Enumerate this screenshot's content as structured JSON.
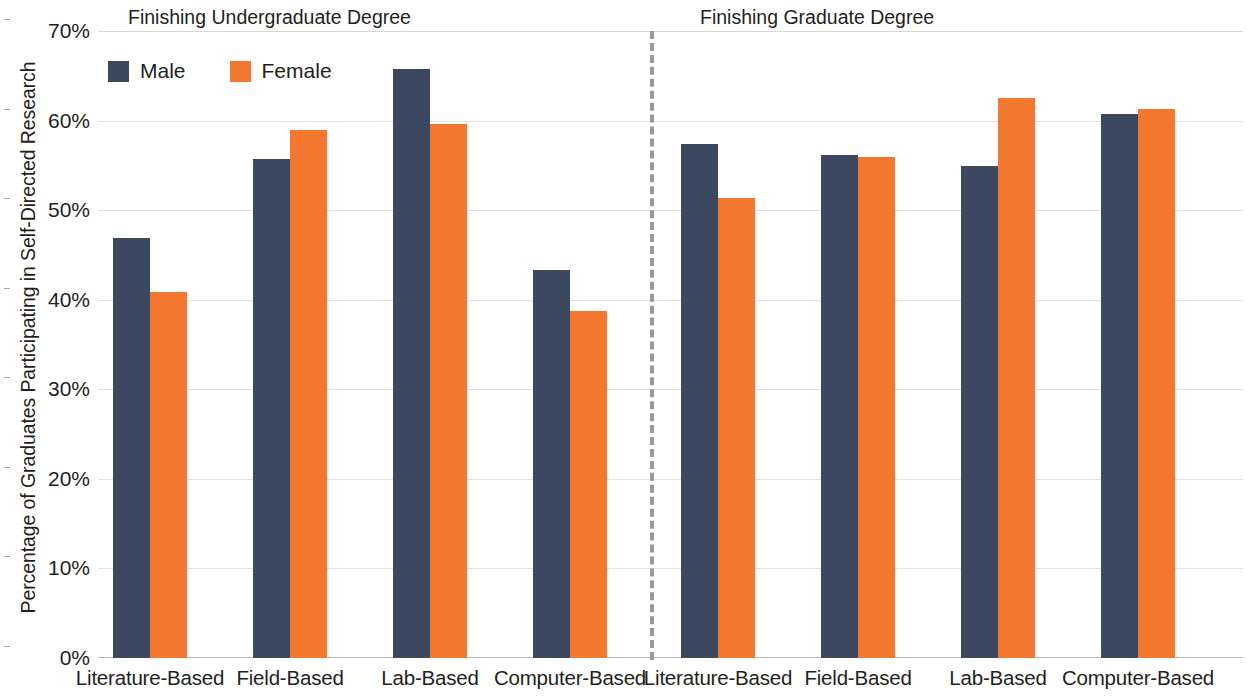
{
  "chart_data": {
    "type": "bar",
    "title": "",
    "xlabel": "",
    "ylabel": "Percentage of Graduates Participating in Self-Directed Research",
    "ylim": [
      0,
      70
    ],
    "ytick_labels": [
      "0%",
      "10%",
      "20%",
      "30%",
      "40%",
      "50%",
      "60%",
      "70%"
    ],
    "ytick_values": [
      0,
      10,
      20,
      30,
      40,
      50,
      60,
      70
    ],
    "grid": true,
    "legend_position": "top-left",
    "legend": [
      "Male",
      "Female"
    ],
    "colors": {
      "male": "#3c4860",
      "female": "#f4772f",
      "divider": "#999999",
      "grid": "#e2e2e2"
    },
    "panels": [
      {
        "title": "Finishing Undergraduate Degree",
        "categories": [
          "Literature-Based",
          "Field-Based",
          "Lab-Based",
          "Computer-Based"
        ],
        "series": [
          {
            "name": "Male",
            "values": [
              46.9,
              55.7,
              65.8,
              43.3
            ]
          },
          {
            "name": "Female",
            "values": [
              40.9,
              58.9,
              59.6,
              38.7
            ]
          }
        ]
      },
      {
        "title": "Finishing Graduate Degree",
        "categories": [
          "Literature-Based",
          "Field-Based",
          "Lab-Based",
          "Computer-Based"
        ],
        "series": [
          {
            "name": "Male",
            "values": [
              57.4,
              56.2,
              54.9,
              60.7
            ]
          },
          {
            "name": "Female",
            "values": [
              51.4,
              55.9,
              62.5,
              61.3
            ]
          }
        ]
      }
    ]
  },
  "axis": {
    "y_title": "Percentage of Graduates Participating in Self-Directed Research"
  },
  "panel_titles": {
    "undergrad": "Finishing Undergraduate Degree",
    "graduate": "Finishing Graduate Degree"
  },
  "legend": {
    "male_label": "Male",
    "female_label": "Female"
  }
}
